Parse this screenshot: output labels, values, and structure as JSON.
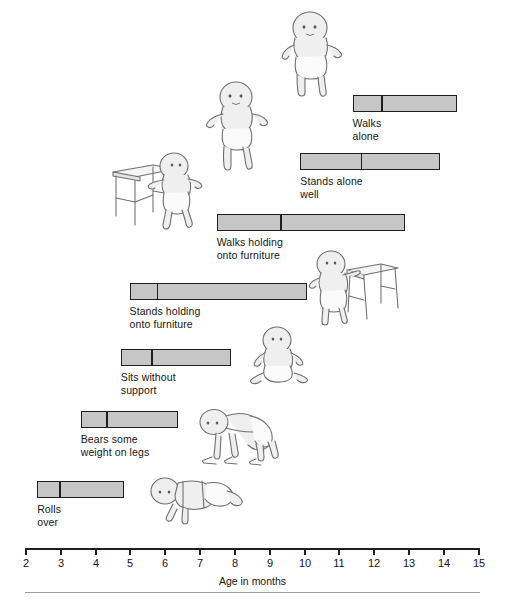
{
  "chart_data": {
    "type": "bar",
    "title": "",
    "subtitle": "",
    "xlabel": "Age in months",
    "ylabel": "",
    "xlim": [
      2,
      15
    ],
    "xticks": [
      2,
      3,
      4,
      5,
      6,
      7,
      8,
      9,
      10,
      11,
      12,
      13,
      14,
      15
    ],
    "xtick_labels": [
      "2",
      "3",
      "4",
      "5",
      "6",
      "7",
      "8",
      "9",
      "10",
      "11",
      "12",
      "13",
      "14",
      "15"
    ],
    "grid": false,
    "legend": "none",
    "orientation": "horizontal",
    "note": "Each horizontal bar spans the age range over which a milestone is achieved; the internal vertical divider marks the median (50th percentile) age.",
    "categories": [
      "Walks alone",
      "Stands alone well",
      "Walks holding onto furniture",
      "Stands holding onto furniture",
      "Sits without support",
      "Bears some weight on legs",
      "Rolls over"
    ],
    "bars": [
      {
        "label": "Walks\nalone",
        "start": 11.4,
        "median": 12.2,
        "end": 14.4
      },
      {
        "label": "Stands alone\nwell",
        "start": 9.9,
        "median": 11.6,
        "end": 13.9
      },
      {
        "label": "Walks holding\nonto furniture",
        "start": 7.5,
        "median": 9.3,
        "end": 12.9
      },
      {
        "label": "Stands holding\nonto furniture",
        "start": 5.0,
        "median": 5.75,
        "end": 10.1
      },
      {
        "label": "Sits without\nsupport",
        "start": 4.75,
        "median": 5.6,
        "end": 7.9
      },
      {
        "label": "Bears some\nweight on legs",
        "start": 3.6,
        "median": 4.3,
        "end": 6.4
      },
      {
        "label": "Rolls\nover",
        "start": 2.35,
        "median": 2.95,
        "end": 4.85
      }
    ],
    "colors": {
      "bar_fill": "#c6c6c6",
      "bar_border": "#1f1f1f",
      "axis": "#1f1f1f",
      "text": "#161616",
      "background": "#ffffff"
    }
  },
  "illustrations": [
    {
      "name": "baby-walking-alone",
      "caption": "toddler walking unaided with arms out"
    },
    {
      "name": "baby-standing-alone",
      "caption": "toddler standing alone, arm extended"
    },
    {
      "name": "baby-cruising-along-table",
      "caption": "baby walking while holding onto a table"
    },
    {
      "name": "baby-pulling-up-on-stool",
      "caption": "baby standing while holding onto a stool"
    },
    {
      "name": "baby-sitting-unsupported",
      "caption": "baby sitting without support"
    },
    {
      "name": "baby-bearing-weight-on-legs",
      "caption": "baby bent over bearing weight on legs"
    },
    {
      "name": "baby-rolling-over",
      "caption": "baby lying down rolling over"
    }
  ]
}
